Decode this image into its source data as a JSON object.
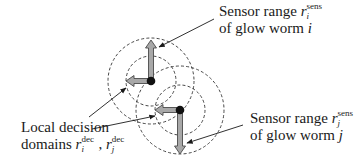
{
  "diagram": {
    "colors": {
      "background": "#ffffff",
      "circle_stroke": "#333333",
      "arrow_fill": "#a8a8a8",
      "arrow_stroke": "#4a4a4a",
      "worm_dot": "#111111",
      "pointer_line": "#1a1a1a",
      "text": "#1a1a1a"
    },
    "nodes": [
      {
        "id": "worm_i",
        "center": [
          151,
          81
        ],
        "sensor_radius": 43,
        "decision_radius": 25,
        "movement_arrows": [
          {
            "direction": "up",
            "tip": [
              151,
              40
            ]
          },
          {
            "direction": "left",
            "tip": [
              126,
              81
            ]
          }
        ]
      },
      {
        "id": "worm_j",
        "center": [
          180,
          110
        ],
        "sensor_radius": 44,
        "decision_radius": 25,
        "movement_arrows": [
          {
            "direction": "down",
            "tip": [
              180,
              154
            ]
          },
          {
            "direction": "left",
            "tip": [
              155,
              110
            ]
          }
        ]
      }
    ],
    "annotations": {
      "sensor_i": {
        "line1_prefix": "Sensor range ",
        "var": "r",
        "sub": "i",
        "sup": "sens",
        "line2_prefix": "of glow worm ",
        "line2_var": "i"
      },
      "sensor_j": {
        "line1_prefix": "Sensor range ",
        "var": "r",
        "sub": "j",
        "sup": "sens",
        "line2_prefix": "of glow worm ",
        "line2_var": "j"
      },
      "decision": {
        "line1": "Local decision",
        "line2_prefix": "domains ",
        "var1": "r",
        "sub1": "i",
        "sup1": "dec",
        "separator": ", ",
        "var2": "r",
        "sub2": "j",
        "sup2": "dec"
      }
    }
  }
}
